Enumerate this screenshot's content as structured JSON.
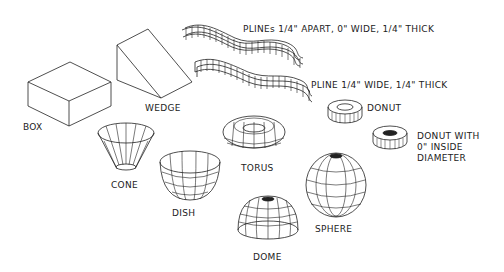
{
  "diagram": {
    "colors": {
      "line": "#222222",
      "background": "#ffffff"
    },
    "shapes": [
      {
        "id": "box",
        "label": "BOX"
      },
      {
        "id": "wedge",
        "label": "WEDGE"
      },
      {
        "id": "plines",
        "label": "PLINEs 1/4\" APART, 0\" WIDE, 1/4\" THICK"
      },
      {
        "id": "pline",
        "label": "PLINE 1/4\" WIDE, 1/4\" THICK"
      },
      {
        "id": "donut",
        "label": "DONUT"
      },
      {
        "id": "donut-solid",
        "label": "DONUT WITH\n0\" INSIDE\nDIAMETER"
      },
      {
        "id": "cone",
        "label": "CONE"
      },
      {
        "id": "dish",
        "label": "DISH"
      },
      {
        "id": "torus",
        "label": "TORUS"
      },
      {
        "id": "dome",
        "label": "DOME"
      },
      {
        "id": "sphere",
        "label": "SPHERE"
      }
    ]
  }
}
